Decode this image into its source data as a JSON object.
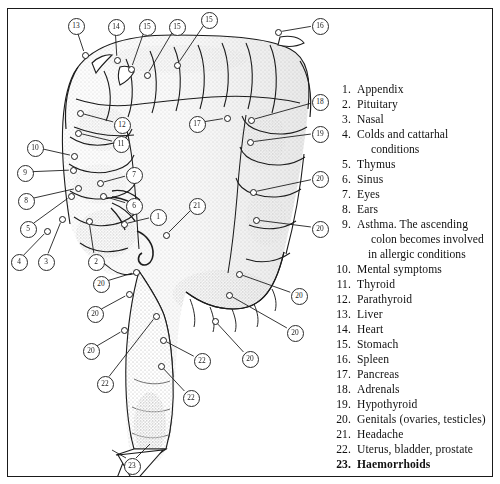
{
  "figure": {
    "kind": "anatomical-diagram"
  },
  "legend": {
    "items": [
      {
        "num": "1.",
        "text": "Appendix",
        "cont": [],
        "bold": false
      },
      {
        "num": "2.",
        "text": "Pituitary",
        "cont": [],
        "bold": false
      },
      {
        "num": "3.",
        "text": "Nasal",
        "cont": [],
        "bold": false
      },
      {
        "num": "4.",
        "text": "Colds and cattarhal",
        "cont": [
          "conditions"
        ],
        "bold": false
      },
      {
        "num": "5.",
        "text": "Thymus",
        "cont": [],
        "bold": false
      },
      {
        "num": "6.",
        "text": "Sinus",
        "cont": [],
        "bold": false
      },
      {
        "num": "7.",
        "text": "Eyes",
        "cont": [],
        "bold": false
      },
      {
        "num": "8.",
        "text": "Ears",
        "cont": [],
        "bold": false
      },
      {
        "num": "9.",
        "text": "Asthma. The ascending",
        "cont": [
          "colon becomes  involved",
          "in allergic conditions"
        ],
        "bold": false
      },
      {
        "num": "10.",
        "text": "Mental symptoms",
        "cont": [],
        "bold": false
      },
      {
        "num": "11.",
        "text": "Thyroid",
        "cont": [],
        "bold": false
      },
      {
        "num": "12.",
        "text": "Parathyroid",
        "cont": [],
        "bold": false
      },
      {
        "num": "13.",
        "text": "Liver",
        "cont": [],
        "bold": false
      },
      {
        "num": "14.",
        "text": "Heart",
        "cont": [],
        "bold": false
      },
      {
        "num": "15.",
        "text": "Stomach",
        "cont": [],
        "bold": false
      },
      {
        "num": "16.",
        "text": "Spleen",
        "cont": [],
        "bold": false
      },
      {
        "num": "17.",
        "text": "Pancreas",
        "cont": [],
        "bold": false
      },
      {
        "num": "18.",
        "text": "Adrenals",
        "cont": [],
        "bold": false
      },
      {
        "num": "19.",
        "text": "Hypothyroid",
        "cont": [],
        "bold": false
      },
      {
        "num": "20.",
        "text": "Genitals (ovaries, testicles)",
        "cont": [],
        "bold": false
      },
      {
        "num": "21.",
        "text": "Headache",
        "cont": [],
        "bold": false
      },
      {
        "num": "22.",
        "text": "Uterus, bladder, prostate",
        "cont": [],
        "bold": false
      },
      {
        "num": "23.",
        "text": "Haemorrhoids",
        "cont": [],
        "bold": true
      }
    ]
  },
  "callouts": [
    {
      "label": "13",
      "cx": 75,
      "cy": 25,
      "nx": 85,
      "ny": 55
    },
    {
      "label": "14",
      "cx": 115,
      "cy": 26,
      "nx": 117,
      "ny": 60
    },
    {
      "label": "15",
      "cx": 146,
      "cy": 26,
      "nx": 131,
      "ny": 69
    },
    {
      "label": "15",
      "cx": 176,
      "cy": 26,
      "nx": 147,
      "ny": 75
    },
    {
      "label": "15",
      "cx": 208,
      "cy": 19,
      "nx": 177,
      "ny": 65
    },
    {
      "label": "16",
      "cx": 319,
      "cy": 25,
      "nx": 278,
      "ny": 32
    },
    {
      "label": "12",
      "cx": 121,
      "cy": 124,
      "nx": 80,
      "ny": 113
    },
    {
      "label": "11",
      "cx": 120,
      "cy": 143,
      "nx": 78,
      "ny": 133
    },
    {
      "label": "10",
      "cx": 34,
      "cy": 147,
      "nx": 74,
      "ny": 156
    },
    {
      "label": "9",
      "cx": 24,
      "cy": 172,
      "nx": 73,
      "ny": 170
    },
    {
      "label": "8",
      "cx": 25,
      "cy": 200,
      "nx": 78,
      "ny": 188
    },
    {
      "label": "7",
      "cx": 133,
      "cy": 174,
      "nx": 100,
      "ny": 183
    },
    {
      "label": "6",
      "cx": 133,
      "cy": 205,
      "nx": 103,
      "ny": 196
    },
    {
      "label": "5",
      "cx": 27,
      "cy": 228,
      "nx": 71,
      "ny": 196
    },
    {
      "label": "4",
      "cx": 18,
      "cy": 261,
      "nx": 47,
      "ny": 231
    },
    {
      "label": "3",
      "cx": 45,
      "cy": 261,
      "nx": 62,
      "ny": 219
    },
    {
      "label": "2",
      "cx": 95,
      "cy": 261,
      "nx": 89,
      "ny": 221
    },
    {
      "label": "1",
      "cx": 157,
      "cy": 216,
      "nx": 124,
      "ny": 224
    },
    {
      "label": "17",
      "cx": 196,
      "cy": 123,
      "nx": 227,
      "ny": 118
    },
    {
      "label": "18",
      "cx": 319,
      "cy": 101,
      "nx": 251,
      "ny": 120
    },
    {
      "label": "19",
      "cx": 319,
      "cy": 133,
      "nx": 250,
      "ny": 142
    },
    {
      "label": "20",
      "cx": 319,
      "cy": 178,
      "nx": 253,
      "ny": 192
    },
    {
      "label": "20",
      "cx": 319,
      "cy": 228,
      "nx": 256,
      "ny": 220
    },
    {
      "label": "21",
      "cx": 196,
      "cy": 205,
      "nx": 166,
      "ny": 235
    },
    {
      "label": "20",
      "cx": 298,
      "cy": 295,
      "nx": 239,
      "ny": 274
    },
    {
      "label": "20",
      "cx": 294,
      "cy": 332,
      "nx": 229,
      "ny": 295
    },
    {
      "label": "20",
      "cx": 249,
      "cy": 358,
      "nx": 215,
      "ny": 321
    },
    {
      "label": "20",
      "cx": 100,
      "cy": 283,
      "nx": 136,
      "ny": 272
    },
    {
      "label": "20",
      "cx": 94,
      "cy": 313,
      "nx": 129,
      "ny": 294
    },
    {
      "label": "20",
      "cx": 90,
      "cy": 350,
      "nx": 124,
      "ny": 330
    },
    {
      "label": "22",
      "cx": 104,
      "cy": 383,
      "nx": 156,
      "ny": 316
    },
    {
      "label": "22",
      "cx": 201,
      "cy": 360,
      "nx": 163,
      "ny": 340
    },
    {
      "label": "22",
      "cx": 190,
      "cy": 397,
      "nx": 161,
      "ny": 366
    },
    {
      "label": "23",
      "cx": 131,
      "cy": 465,
      "nx": 0,
      "ny": 0
    }
  ]
}
